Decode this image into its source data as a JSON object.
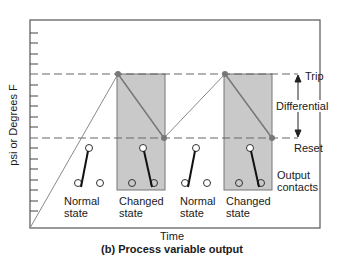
{
  "figure": {
    "caption": "(b) Process variable output",
    "x_axis_label": "Time",
    "y_axis_label": "psi or Degrees F"
  },
  "levels": {
    "trip_label": "Trip",
    "reset_label": "Reset",
    "differential_label": "Differential"
  },
  "states": [
    {
      "line1": "Normal",
      "line2": "state"
    },
    {
      "line1": "Changed",
      "line2": "state"
    },
    {
      "line1": "Normal",
      "line2": "state"
    },
    {
      "line1": "Changed",
      "line2": "state"
    }
  ],
  "contacts_label": {
    "line1": "Output",
    "line2": "contacts"
  },
  "colors": {
    "frame": "#555555",
    "shade": "#c8c8c8",
    "dashed": "#666666",
    "signal": "#888888",
    "dot": "#777777",
    "switch": "#111111"
  }
}
